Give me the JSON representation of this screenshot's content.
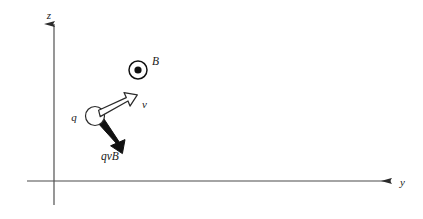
{
  "figure": {
    "kind": "physics-vector-diagram",
    "background_color": "#ffffff",
    "stroke_color": "#2b2b2b",
    "fill_black": "#111111",
    "fill_white": "#ffffff",
    "width": 423,
    "height": 219
  },
  "axes": {
    "vertical": {
      "label": "z",
      "label_x": 51,
      "label_y": 19,
      "x": 54,
      "y_top": 24,
      "y_bottom": 205,
      "arrow_at": "top"
    },
    "horizontal": {
      "label": "y",
      "label_x": 400,
      "label_y": 186,
      "y": 181,
      "x_left": 27,
      "x_right": 391,
      "arrow_at": "right"
    }
  },
  "field": {
    "label": "B",
    "label_x": 152,
    "label_y": 65,
    "symbol": "dot-in-circle",
    "meaning": "out-of-page",
    "center_x": 138,
    "center_y": 70,
    "outer_radius": 9,
    "inner_radius": 3.6
  },
  "charge": {
    "label": "q",
    "label_x": 74,
    "label_y": 121,
    "center_x": 95,
    "center_y": 116,
    "radius": 9.5
  },
  "velocity": {
    "label": "v",
    "label_x": 142,
    "label_y": 108,
    "style": "hollow-outlined-arrow",
    "from_x": 101,
    "from_y": 112,
    "to_x": 135,
    "to_y": 96
  },
  "force": {
    "label": "qvB",
    "label_x": 101,
    "label_y": 160,
    "style": "solid-filled-arrow",
    "from_x": 99,
    "from_y": 123,
    "to_x": 122,
    "to_y": 150
  }
}
